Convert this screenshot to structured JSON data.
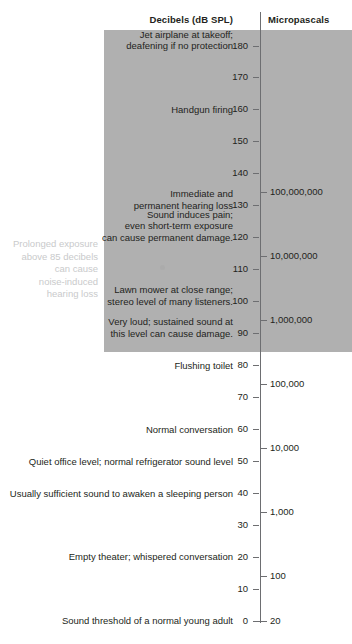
{
  "headers": {
    "decibels": "Decibels (dB SPL)",
    "micropascals": "Micropascals"
  },
  "side_note": {
    "lines": [
      "Prolonged exposure",
      "above 85 decibels",
      "can cause",
      "noise-induced",
      "hearing loss"
    ]
  },
  "colors": {
    "danger_band": "#b0b0b0",
    "axis": "#6d6e71",
    "text": "#231f20",
    "side_note_text": "#c9cacb",
    "background": "#ffffff"
  },
  "chart_data": {
    "type": "table",
    "ylabel": "Decibels (dB SPL)",
    "y2label": "Micropascals",
    "ylim": [
      0,
      180
    ],
    "grid": false,
    "legend": "none",
    "db_ticks": [
      {
        "value": 180,
        "label": "180"
      },
      {
        "value": 170,
        "label": "170"
      },
      {
        "value": 160,
        "label": "160"
      },
      {
        "value": 150,
        "label": "150"
      },
      {
        "value": 140,
        "label": "140"
      },
      {
        "value": 130,
        "label": "130"
      },
      {
        "value": 120,
        "label": "120"
      },
      {
        "value": 110,
        "label": "110"
      },
      {
        "value": 100,
        "label": "100"
      },
      {
        "value": 90,
        "label": "90"
      },
      {
        "value": 80,
        "label": "80"
      },
      {
        "value": 70,
        "label": "70"
      },
      {
        "value": 60,
        "label": "60"
      },
      {
        "value": 50,
        "label": "50"
      },
      {
        "value": 40,
        "label": "40"
      },
      {
        "value": 30,
        "label": "30"
      },
      {
        "value": 20,
        "label": "20"
      },
      {
        "value": 10,
        "label": "10"
      },
      {
        "value": 0,
        "label": "0"
      }
    ],
    "micropascal_ticks": [
      {
        "db": 134,
        "label": "100,000,000"
      },
      {
        "db": 114,
        "label": "10,000,000"
      },
      {
        "db": 94,
        "label": "1,000,000"
      },
      {
        "db": 74,
        "label": "100,000"
      },
      {
        "db": 54,
        "label": "10,000"
      },
      {
        "db": 34,
        "label": "1,000"
      },
      {
        "db": 14,
        "label": "100"
      },
      {
        "db": 0,
        "label": "20"
      }
    ],
    "annotations": [
      {
        "db": 180,
        "lines": [
          "Jet airplane at takeoff;",
          "deafening if no protection"
        ]
      },
      {
        "db": 160,
        "lines": [
          "Handgun firing"
        ]
      },
      {
        "db": 130,
        "lines": [
          "Immediate and",
          "permanent hearing loss"
        ]
      },
      {
        "db": 120,
        "lines": [
          "Sound induces pain;",
          "even short-term exposure",
          "can cause permanent damage."
        ]
      },
      {
        "db": 100,
        "lines": [
          "Lawn mower at close range;",
          "stereo level of many listeners."
        ]
      },
      {
        "db": 90,
        "lines": [
          "Very loud; sustained sound at",
          "this level can cause damage."
        ]
      },
      {
        "db": 80,
        "lines": [
          "Flushing toilet"
        ]
      },
      {
        "db": 60,
        "lines": [
          "Normal conversation"
        ]
      },
      {
        "db": 50,
        "lines": [
          "Quiet office level; normal refrigerator sound level"
        ]
      },
      {
        "db": 40,
        "lines": [
          "Usually sufficient sound to awaken a sleeping person"
        ]
      },
      {
        "db": 20,
        "lines": [
          "Empty theater; whispered conversation"
        ]
      },
      {
        "db": 0,
        "lines": [
          "Sound threshold of a normal young adult"
        ]
      }
    ],
    "danger_band": {
      "from_db": 86,
      "to_db": 185
    }
  }
}
